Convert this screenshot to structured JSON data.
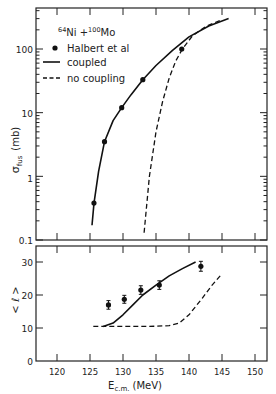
{
  "chart_data": [
    {
      "type": "line",
      "title": "64Ni + 100Mo",
      "reaction": {
        "proj_mass": "64",
        "proj": "Ni",
        "targ_mass": "100",
        "targ": "Mo"
      },
      "xlabel": "E c.m. (MeV)",
      "ylabel": "σ fus (mb)",
      "yscale": "log",
      "ylim": [
        0.1,
        400
      ],
      "xlim": [
        116,
        152
      ],
      "yticks": [
        "0.1",
        "1",
        "10",
        "100"
      ],
      "legend": [
        {
          "label": "Halbert et al",
          "style": "marker"
        },
        {
          "label": "coupled",
          "style": "solid"
        },
        {
          "label": "no coupling",
          "style": "dashed"
        }
      ],
      "series": [
        {
          "name": "Halbert et al",
          "kind": "scatter",
          "x": [
            125.6,
            127.2,
            129.8,
            133.0,
            138.9
          ],
          "y": [
            0.38,
            3.5,
            12,
            33,
            100
          ]
        },
        {
          "name": "coupled",
          "kind": "line",
          "x": [
            125.3,
            125.6,
            126.3,
            127.2,
            128.5,
            129.8,
            131.2,
            133.0,
            135.0,
            137.5,
            140.0,
            143.0,
            146.0
          ],
          "y": [
            0.17,
            0.38,
            1.2,
            3.5,
            7.5,
            12,
            19,
            33,
            55,
            95,
            155,
            230,
            300
          ]
        },
        {
          "name": "no coupling",
          "kind": "line",
          "x": [
            133.2,
            134.0,
            135.0,
            136.0,
            137.0,
            138.0,
            139.0,
            140.5,
            142.5,
            145.0
          ],
          "y": [
            0.13,
            1.0,
            5,
            15,
            35,
            65,
            100,
            160,
            225,
            290
          ]
        }
      ]
    },
    {
      "type": "line",
      "xlabel": "E c.m. (MeV)",
      "ylabel": "< ℓ >",
      "ylim": [
        0,
        32
      ],
      "xlim": [
        116,
        152
      ],
      "yticks": [
        "0",
        "10",
        "20",
        "30"
      ],
      "xticks": [
        "120",
        "125",
        "130",
        "135",
        "140",
        "145",
        "150"
      ],
      "series": [
        {
          "name": "Halbert et al",
          "kind": "scatter",
          "x": [
            127.8,
            130.2,
            132.7,
            135.5,
            141.8
          ],
          "y": [
            17.0,
            18.7,
            21.5,
            23.0,
            28.7
          ],
          "err": [
            1.3,
            1.2,
            1.3,
            1.3,
            1.5
          ]
        },
        {
          "name": "coupled",
          "kind": "line",
          "x": [
            127.0,
            128.5,
            130.0,
            131.5,
            133.0,
            135.0,
            137.0,
            139.0,
            141.0
          ],
          "y": [
            10.5,
            11.5,
            14.0,
            17.0,
            20.0,
            23.0,
            25.8,
            28.0,
            30.0
          ]
        },
        {
          "name": "no coupling",
          "kind": "line",
          "x": [
            125.5,
            128.0,
            131.0,
            134.0,
            137.0,
            138.5,
            140.0,
            142.0,
            143.5,
            144.8
          ],
          "y": [
            10.5,
            10.5,
            10.5,
            10.5,
            10.7,
            11.5,
            14.0,
            19.0,
            23.0,
            26.0
          ]
        }
      ]
    }
  ],
  "labels": {
    "proj_mass": "64",
    "proj": "Ni +",
    "targ_mass": "100",
    "targ": "Mo",
    "legend_data": "Halbert et al",
    "legend_coupled": "coupled",
    "legend_nocoupling": "no coupling",
    "ylabel_top_sigma": "σ",
    "ylabel_top_sub": "fus",
    "ylabel_top_unit": "(mb)",
    "ylabel_bottom": "< ℓ >",
    "xlabel_E": "E",
    "xlabel_sub": "c.m.",
    "xlabel_unit": "(MeV)",
    "ytop": [
      "100",
      "10",
      "1",
      "0.1"
    ],
    "ybot": [
      "30",
      "20",
      "10",
      "0"
    ],
    "x": [
      "120",
      "125",
      "130",
      "135",
      "140",
      "145",
      "150"
    ]
  }
}
